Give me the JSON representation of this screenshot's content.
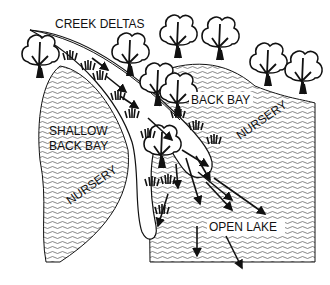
{
  "diagram": {
    "colors": {
      "ink": "#111111",
      "paper": "#ffffff",
      "water_lines": "#555555"
    },
    "labels": {
      "creek_deltas": "CREEK DELTAS",
      "back_bay": "BACK BAY",
      "shallow_back_bay_line1": "SHALLOW",
      "shallow_back_bay_line2": "BACK BAY",
      "nursery_left": "NURSERY",
      "nursery_right": "NURSERY",
      "open_lake": "OPEN LAKE"
    },
    "icons": [
      "tree-icon",
      "reed-grass-icon",
      "flow-arrow-icon",
      "water-wave-pattern"
    ]
  }
}
